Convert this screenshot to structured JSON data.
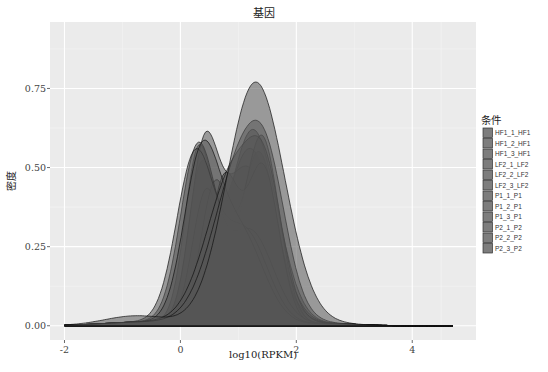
{
  "chart_data": {
    "type": "area",
    "subtype": "density",
    "title": "基因",
    "xlabel": "log10(RPKM)",
    "ylabel": "密度",
    "xlim": [
      -2.25,
      5.1
    ],
    "ylim": [
      -0.045,
      0.96
    ],
    "x_ticks": [
      -2,
      0,
      2,
      4
    ],
    "x_tick_labels": [
      "-2",
      "0",
      "2",
      "4"
    ],
    "y_ticks": [
      0.0,
      0.25,
      0.5,
      0.75
    ],
    "y_tick_labels": [
      "0.00",
      "0.25",
      "0.50",
      "0.75"
    ],
    "grid": true,
    "legend_position": "right",
    "legend_title": "条件",
    "fill_color": "#555555",
    "fill_opacity": 0.55,
    "series": [
      {
        "name": "HF1_1_HF1",
        "components": [
          [
            0.35,
            0.45,
            0.22
          ],
          [
            1.25,
            0.62,
            0.42
          ]
        ]
      },
      {
        "name": "HF1_2_HF1",
        "components": [
          [
            0.3,
            0.5,
            0.23
          ],
          [
            1.2,
            0.56,
            0.43
          ]
        ]
      },
      {
        "name": "HF1_3_HF1",
        "components": [
          [
            0.4,
            0.48,
            0.24
          ],
          [
            1.15,
            0.5,
            0.44
          ]
        ]
      },
      {
        "name": "LF2_1_LF2",
        "components": [
          [
            0.45,
            0.42,
            0.24
          ],
          [
            1.35,
            0.55,
            0.32
          ]
        ]
      },
      {
        "name": "LF2_2_LF2",
        "components": [
          [
            0.6,
            0.44,
            0.25
          ],
          [
            1.4,
            0.6,
            0.3
          ]
        ]
      },
      {
        "name": "LF2_3_LF2",
        "components": [
          [
            0.75,
            0.45,
            0.25
          ],
          [
            1.42,
            0.5,
            0.28
          ]
        ]
      },
      {
        "name": "P1_1_P1",
        "components": [
          [
            0.3,
            0.55,
            0.3
          ],
          [
            1.2,
            0.3,
            0.4
          ]
        ]
      },
      {
        "name": "P1_2_P1",
        "components": [
          [
            0.25,
            0.52,
            0.32
          ],
          [
            1.1,
            0.3,
            0.4
          ]
        ]
      },
      {
        "name": "P1_3_P1",
        "components": [
          [
            0.35,
            0.48,
            0.3
          ],
          [
            1.0,
            0.3,
            0.42
          ]
        ]
      },
      {
        "name": "P2_1_P2",
        "components": [
          [
            0.95,
            0.5,
            0.48
          ],
          [
            1.5,
            0.28,
            0.28
          ]
        ]
      },
      {
        "name": "P2_2_P2",
        "components": [
          [
            1.1,
            0.55,
            0.5
          ],
          [
            1.55,
            0.2,
            0.3
          ]
        ]
      },
      {
        "name": "P2_3_P2",
        "components": [
          [
            1.3,
            0.77,
            0.5
          ],
          [
            -0.8,
            0.02,
            0.5
          ]
        ]
      }
    ],
    "approx_peaks": [
      {
        "x": 1.5,
        "y": 0.92
      },
      {
        "x": 1.35,
        "y": 0.85
      },
      {
        "x": 1.2,
        "y": 0.7
      },
      {
        "x": 0.8,
        "y": 0.65
      },
      {
        "x": 0.45,
        "y": 0.64
      },
      {
        "x": 0.35,
        "y": 0.6
      }
    ],
    "x_range_data": [
      -2.0,
      4.7
    ]
  }
}
